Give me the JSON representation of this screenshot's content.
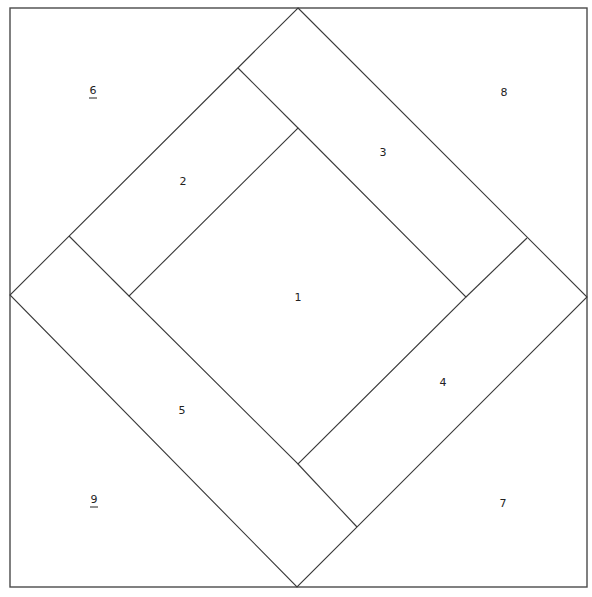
{
  "diagram": {
    "type": "quilt-block-foundation-pattern",
    "colors": {
      "line": "#3a3a3a",
      "background": "#ffffff",
      "label": "#222222"
    },
    "pieces": [
      {
        "id": "1",
        "label": "1",
        "underlined": false,
        "x": 298,
        "y": 298
      },
      {
        "id": "2",
        "label": "2",
        "underlined": false,
        "x": 183,
        "y": 182
      },
      {
        "id": "3",
        "label": "3",
        "underlined": false,
        "x": 383,
        "y": 153
      },
      {
        "id": "4",
        "label": "4",
        "underlined": false,
        "x": 443,
        "y": 383
      },
      {
        "id": "5",
        "label": "5",
        "underlined": false,
        "x": 182,
        "y": 411
      },
      {
        "id": "6",
        "label": "6",
        "underlined": true,
        "x": 93,
        "y": 91
      },
      {
        "id": "7",
        "label": "7",
        "underlined": false,
        "x": 503,
        "y": 504
      },
      {
        "id": "8",
        "label": "8",
        "underlined": false,
        "x": 504,
        "y": 93
      },
      {
        "id": "9",
        "label": "9",
        "underlined": true,
        "x": 94,
        "y": 500
      }
    ]
  }
}
